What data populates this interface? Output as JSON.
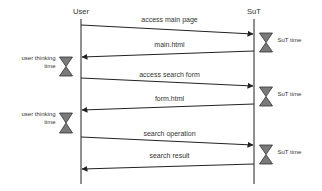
{
  "diagram": {
    "type": "sequence",
    "colors": {
      "line": "#222222",
      "hourglass_fill": "#7a7a7a",
      "hourglass_stroke": "#333333",
      "text": "#333333",
      "background": "#ffffff"
    },
    "actors": [
      {
        "id": "user",
        "label": "User",
        "x": 81
      },
      {
        "id": "sut",
        "label": "SuT",
        "x": 254
      }
    ],
    "messages": [
      {
        "id": "msg-access-main-page",
        "label": "access main page",
        "from": "user",
        "to": "sut",
        "y1": 25,
        "y2": 34,
        "label_y": 22
      },
      {
        "id": "msg-main-html",
        "label": "main.html",
        "from": "sut",
        "to": "user",
        "y1": 51,
        "y2": 57,
        "label_y": 47
      },
      {
        "id": "msg-access-search-form",
        "label": "access search form",
        "from": "user",
        "to": "sut",
        "y1": 78,
        "y2": 86,
        "label_y": 77
      },
      {
        "id": "msg-form-html",
        "label": "form.html",
        "from": "sut",
        "to": "user",
        "y1": 104,
        "y2": 110,
        "label_y": 101
      },
      {
        "id": "msg-search-operation",
        "label": "search operation",
        "from": "user",
        "to": "sut",
        "y1": 137,
        "y2": 145,
        "label_y": 136
      },
      {
        "id": "msg-search-result",
        "label": "search result",
        "from": "sut",
        "to": "user",
        "y1": 164,
        "y2": 169,
        "label_y": 158
      }
    ],
    "delays": [
      {
        "id": "sut-time-1",
        "actor": "sut",
        "label_lines": [
          "SuT time"
        ],
        "y_top": 33,
        "y_bottom": 52
      },
      {
        "id": "user-thinking-1",
        "actor": "user",
        "label_lines": [
          "user thinking",
          "time"
        ],
        "y_top": 57,
        "y_bottom": 76
      },
      {
        "id": "sut-time-2",
        "actor": "sut",
        "label_lines": [
          "SuT time"
        ],
        "y_top": 87,
        "y_bottom": 106
      },
      {
        "id": "user-thinking-2",
        "actor": "user",
        "label_lines": [
          "user thinking",
          "time"
        ],
        "y_top": 113,
        "y_bottom": 133
      },
      {
        "id": "sut-time-3",
        "actor": "sut",
        "label_lines": [
          "SuT time"
        ],
        "y_top": 145,
        "y_bottom": 164
      }
    ],
    "lifeline": {
      "y_top": 19,
      "y_bottom": 184
    }
  }
}
